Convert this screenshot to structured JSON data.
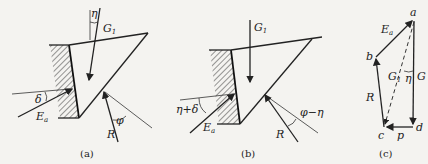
{
  "figure": {
    "panels": [
      {
        "id": "a",
        "caption": "(a)",
        "labels": {
          "weight": "G",
          "weight_sub": "1",
          "inclination_angle": "η",
          "wall_friction_angle": "δ",
          "earth_pressure": "E",
          "earth_pressure_sub": "a",
          "reaction": "R",
          "soil_friction_angle": "φ"
        }
      },
      {
        "id": "b",
        "caption": "(b)",
        "labels": {
          "weight": "G",
          "weight_sub": "1",
          "combined_angle": "η+δ",
          "earth_pressure": "E",
          "earth_pressure_sub": "a",
          "reaction": "R",
          "reduced_angle": "φ−η"
        }
      },
      {
        "id": "c",
        "caption": "(c)",
        "labels": {
          "point_a": "a",
          "point_b": "b",
          "point_c": "c",
          "point_d": "d",
          "earth_pressure": "E",
          "earth_pressure_sub": "a",
          "weight_total": "G",
          "weight_component": "G",
          "weight_component_sub": "1",
          "angle": "η",
          "reaction": "R",
          "force_p": "p"
        }
      }
    ]
  }
}
